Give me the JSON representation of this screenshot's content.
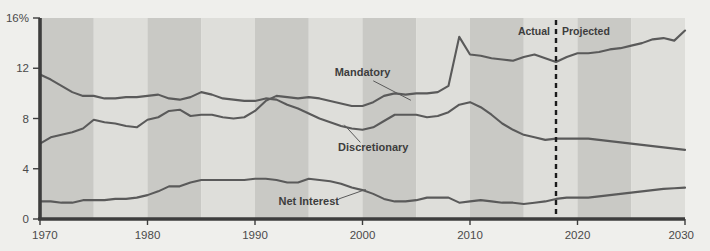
{
  "chart_data": {
    "type": "line",
    "title": "",
    "subtitle": "",
    "xlabel": "",
    "ylabel": "",
    "xlim": [
      1970,
      2030
    ],
    "ylim": [
      0,
      16
    ],
    "grid": false,
    "legend_position": "inline-annotations",
    "y_ticks": [
      0,
      4,
      8,
      12,
      16
    ],
    "y_tick_labels": [
      "0",
      "4",
      "8",
      "12",
      "16%"
    ],
    "x_ticks": [
      1970,
      1980,
      1990,
      2000,
      2010,
      2020,
      2030
    ],
    "x_tick_labels": [
      "1970",
      "1980",
      "1990",
      "2000",
      "2010",
      "2020",
      "2030"
    ],
    "band_interval_years": 5,
    "annotations": {
      "divider_year": 2018,
      "actual_label": "Actual",
      "projected_label": "Projected"
    },
    "series": [
      {
        "name": "Mandatory",
        "label": "Mandatory",
        "color": "#5a5a5a",
        "label_x": 2000,
        "label_y": 11.4,
        "x": [
          1970,
          1971,
          1972,
          1973,
          1974,
          1975,
          1976,
          1977,
          1978,
          1979,
          1980,
          1981,
          1982,
          1983,
          1984,
          1985,
          1986,
          1987,
          1988,
          1989,
          1990,
          1991,
          1992,
          1993,
          1994,
          1995,
          1996,
          1997,
          1998,
          1999,
          2000,
          2001,
          2002,
          2003,
          2004,
          2005,
          2006,
          2007,
          2008,
          2009,
          2010,
          2011,
          2012,
          2013,
          2014,
          2015,
          2016,
          2017,
          2018,
          2019,
          2020,
          2021,
          2022,
          2023,
          2024,
          2025,
          2026,
          2027,
          2028,
          2029,
          2030
        ],
        "y": [
          6.0,
          6.5,
          6.7,
          6.9,
          7.2,
          7.9,
          7.7,
          7.6,
          7.4,
          7.3,
          7.9,
          8.1,
          8.6,
          8.7,
          8.2,
          8.3,
          8.3,
          8.1,
          8.0,
          8.1,
          8.6,
          9.4,
          9.8,
          9.7,
          9.6,
          9.7,
          9.6,
          9.4,
          9.2,
          9.0,
          9.0,
          9.3,
          9.8,
          10.0,
          9.9,
          10.0,
          10.0,
          10.1,
          10.6,
          14.5,
          13.1,
          13.0,
          12.8,
          12.7,
          12.6,
          12.9,
          13.1,
          12.8,
          12.5,
          12.9,
          13.2,
          13.2,
          13.3,
          13.5,
          13.6,
          13.8,
          14.0,
          14.3,
          14.4,
          14.2,
          15.0
        ]
      },
      {
        "name": "Discretionary",
        "label": "Discretionary",
        "color": "#5a5a5a",
        "label_x": 2001,
        "label_y": 5.4,
        "x": [
          1970,
          1971,
          1972,
          1973,
          1974,
          1975,
          1976,
          1977,
          1978,
          1979,
          1980,
          1981,
          1982,
          1983,
          1984,
          1985,
          1986,
          1987,
          1988,
          1989,
          1990,
          1991,
          1992,
          1993,
          1994,
          1995,
          1996,
          1997,
          1998,
          1999,
          2000,
          2001,
          2002,
          2003,
          2004,
          2005,
          2006,
          2007,
          2008,
          2009,
          2010,
          2011,
          2012,
          2013,
          2014,
          2015,
          2016,
          2017,
          2018,
          2019,
          2020,
          2021,
          2022,
          2023,
          2024,
          2025,
          2026,
          2027,
          2028,
          2029,
          2030
        ],
        "y": [
          11.5,
          11.1,
          10.6,
          10.1,
          9.8,
          9.8,
          9.6,
          9.6,
          9.7,
          9.7,
          9.8,
          9.9,
          9.6,
          9.5,
          9.7,
          10.1,
          9.9,
          9.6,
          9.5,
          9.4,
          9.4,
          9.6,
          9.5,
          9.1,
          8.8,
          8.4,
          8.0,
          7.7,
          7.4,
          7.2,
          7.1,
          7.3,
          7.8,
          8.3,
          8.3,
          8.3,
          8.1,
          8.2,
          8.5,
          9.1,
          9.3,
          8.9,
          8.3,
          7.6,
          7.1,
          6.7,
          6.5,
          6.3,
          6.4,
          6.4,
          6.4,
          6.4,
          6.3,
          6.2,
          6.1,
          6.0,
          5.9,
          5.8,
          5.7,
          5.6,
          5.5
        ]
      },
      {
        "name": "Net Interest",
        "label": "Net Interest",
        "color": "#5a5a5a",
        "label_x": 1996,
        "label_y": 1.1,
        "x": [
          1970,
          1971,
          1972,
          1973,
          1974,
          1975,
          1976,
          1977,
          1978,
          1979,
          1980,
          1981,
          1982,
          1983,
          1984,
          1985,
          1986,
          1987,
          1988,
          1989,
          1990,
          1991,
          1992,
          1993,
          1994,
          1995,
          1996,
          1997,
          1998,
          1999,
          2000,
          2001,
          2002,
          2003,
          2004,
          2005,
          2006,
          2007,
          2008,
          2009,
          2010,
          2011,
          2012,
          2013,
          2014,
          2015,
          2016,
          2017,
          2018,
          2019,
          2020,
          2021,
          2022,
          2023,
          2024,
          2025,
          2026,
          2027,
          2028,
          2029,
          2030
        ],
        "y": [
          1.4,
          1.4,
          1.3,
          1.3,
          1.5,
          1.5,
          1.5,
          1.6,
          1.6,
          1.7,
          1.9,
          2.2,
          2.6,
          2.6,
          2.9,
          3.1,
          3.1,
          3.1,
          3.1,
          3.1,
          3.2,
          3.2,
          3.1,
          2.9,
          2.9,
          3.2,
          3.1,
          3.0,
          2.8,
          2.5,
          2.3,
          2.0,
          1.6,
          1.4,
          1.4,
          1.5,
          1.7,
          1.7,
          1.7,
          1.3,
          1.4,
          1.5,
          1.4,
          1.3,
          1.3,
          1.2,
          1.3,
          1.4,
          1.6,
          1.7,
          1.7,
          1.7,
          1.8,
          1.9,
          2.0,
          2.1,
          2.2,
          2.3,
          2.4,
          2.45,
          2.5
        ]
      }
    ]
  },
  "colors": {
    "background": "#efefec",
    "band_dark": "#c9c9c5",
    "band_light": "#dededa",
    "axis": "#3d3d3d",
    "line": "#5a5a5a",
    "text": "#4a4a4a"
  }
}
